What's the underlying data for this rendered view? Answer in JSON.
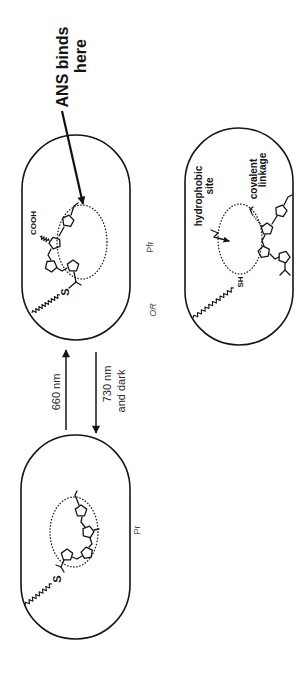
{
  "figure": {
    "annotation": {
      "line1": "ANS binds",
      "line2": "here"
    },
    "states": {
      "pfr_label": "Pfr",
      "pr_label": "Pr",
      "or_label": "OR"
    },
    "transitions": {
      "forward_label": "660 nm",
      "reverse_line1": "730 nm",
      "reverse_line2": "and dark"
    },
    "pfr_capsule": {
      "acid_group": "COOH",
      "thioether": "S"
    },
    "alternative_capsule": {
      "thiol": "SH",
      "site_line1": "hydrophobic",
      "site_line2": "site",
      "linkage_line1": "covalent",
      "linkage_line2": "linkage"
    },
    "pr_capsule": {
      "thioether": "S"
    }
  }
}
